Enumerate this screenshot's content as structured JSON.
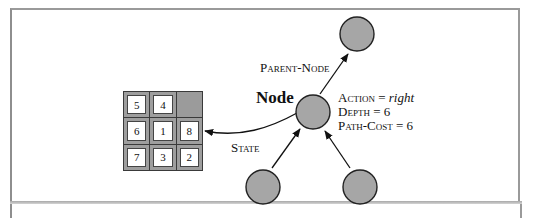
{
  "diagram": {
    "node_label": "Node",
    "parent_label": "Parent-Node",
    "state_label": "State",
    "fields": [
      {
        "name": "Action",
        "value": "right",
        "value_italic": true
      },
      {
        "name": "Depth",
        "value": "6"
      },
      {
        "name": "Path-Cost",
        "value": "6"
      }
    ],
    "field_lines": {
      "action_name": "Action",
      "action_eq": " = ",
      "action_value": "right",
      "depth": "Depth = 6",
      "path_cost": "Path-Cost = 6"
    },
    "puzzle_tiles": [
      "5",
      "4",
      "",
      "6",
      "1",
      "8",
      "7",
      "3",
      "2"
    ],
    "colors": {
      "node_fill": "#a6a6a6",
      "node_stroke": "#222222",
      "tile_frame": "#9e9e9e",
      "blank_tile": "#9b9b9b"
    }
  }
}
